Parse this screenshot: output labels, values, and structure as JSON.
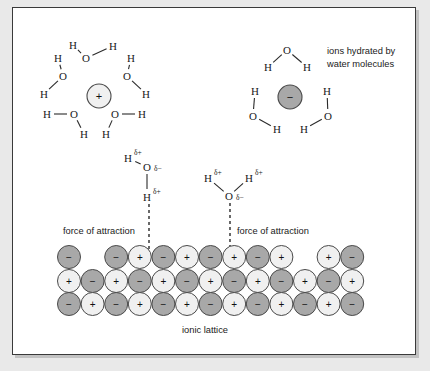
{
  "diagram": {
    "background_color": "#e9e9e9",
    "panel_color": "#ffffff",
    "border_color": "#3a3a3a"
  },
  "labels": {
    "hydration_note_line1": "ions hydrated by",
    "hydration_note_line2": "water molecules",
    "force_left": "force of attraction",
    "force_right": "force of attraction",
    "lattice_caption": "ionic lattice"
  },
  "symbols": {
    "hydrogen": "H",
    "oxygen": "O",
    "delta_plus": "δ+",
    "delta_minus": "δ−",
    "plus": "+",
    "minus": "−"
  },
  "ions": {
    "cation": {
      "sign": "+",
      "fill": "#f0f0f0",
      "stroke": "#4a4a4a",
      "cx": 98,
      "cy": 95,
      "r": 12
    },
    "anion": {
      "sign": "−",
      "fill": "#a8a8a8",
      "stroke": "#4a4a4a",
      "cx": 289,
      "cy": 96,
      "r": 12
    }
  },
  "cation_waters": [
    {
      "id": "top",
      "o": [
        85,
        57
      ],
      "h": [
        [
          72,
          44
        ],
        [
          112,
          45
        ]
      ]
    },
    {
      "id": "upper-left",
      "o": [
        62,
        75
      ],
      "h": [
        [
          57,
          57
        ],
        [
          43,
          93
        ]
      ]
    },
    {
      "id": "upper-right",
      "o": [
        126,
        75
      ],
      "h": [
        [
          130,
          57
        ],
        [
          145,
          93
        ]
      ]
    },
    {
      "id": "lower-left",
      "o": [
        73,
        113
      ],
      "h": [
        [
          46,
          113
        ],
        [
          83,
          133
        ]
      ]
    },
    {
      "id": "lower-right",
      "o": [
        114,
        113
      ],
      "h": [
        [
          141,
          113
        ],
        [
          105,
          133
        ]
      ]
    }
  ],
  "anion_waters": [
    {
      "id": "top",
      "o": [
        286,
        49
      ],
      "h": [
        [
          267,
          66
        ],
        [
          306,
          66
        ]
      ]
    },
    {
      "id": "left",
      "o": [
        252,
        115
      ],
      "h": [
        [
          254,
          90
        ],
        [
          276,
          128
        ]
      ]
    },
    {
      "id": "right",
      "o": [
        327,
        115
      ],
      "h": [
        [
          326,
          90
        ],
        [
          303,
          128
        ]
      ]
    }
  ],
  "delta_waters": [
    {
      "id": "left-dipole",
      "o": [
        146,
        166
      ],
      "o_charge": "δ−",
      "h": [
        {
          "pos": [
            127,
            157
          ],
          "charge": "δ+"
        },
        {
          "pos": [
            146,
            196
          ],
          "charge": "δ+"
        }
      ],
      "dash_from": [
        148,
        203
      ],
      "dash_to": [
        148,
        249
      ]
    },
    {
      "id": "right-dipole",
      "o": [
        228,
        195
      ],
      "o_charge": "δ−",
      "h": [
        {
          "pos": [
            207,
            177
          ],
          "charge": "δ+"
        },
        {
          "pos": [
            248,
            177
          ],
          "charge": "δ+"
        }
      ],
      "dash_from": [
        229,
        202
      ],
      "dash_to": [
        229,
        249
      ]
    }
  ],
  "lattice": {
    "radius": 11.5,
    "spacing": 23.6,
    "x_start": 68,
    "row_y": [
      256,
      280,
      303
    ],
    "colors": {
      "positive": "#f0f0f0",
      "negative": "#a8a8a8",
      "stroke": "#4a4a4a"
    },
    "rows": [
      [
        "−",
        null,
        "−",
        "+",
        "−",
        "+",
        "−",
        "+",
        "−",
        "+",
        null,
        "+",
        "−"
      ],
      [
        "+",
        "−",
        "+",
        "−",
        "+",
        "−",
        "+",
        "−",
        "+",
        "−",
        "+",
        "−",
        "+"
      ],
      [
        "−",
        "+",
        "−",
        "+",
        "−",
        "+",
        "−",
        "+",
        "−",
        "+",
        "−",
        "+",
        "−"
      ]
    ]
  },
  "text_positions": {
    "hydration_note": [
      326,
      53
    ],
    "force_left": [
      62,
      233
    ],
    "force_right": [
      236,
      233
    ],
    "lattice_caption": [
      181,
      332
    ]
  }
}
